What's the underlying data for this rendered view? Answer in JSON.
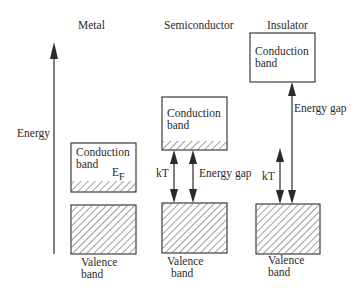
{
  "diagram": {
    "type": "energy band diagram",
    "axis": {
      "label": "Energy",
      "direction": "up"
    },
    "columns": [
      {
        "title": "Metal",
        "conduction_band": {
          "label_line1": "Conduction",
          "label_line2": "band",
          "partially_filled": true
        },
        "fermi_level": {
          "label": "E",
          "subscript": "F"
        },
        "valence_band": {
          "label_line1": "Valence",
          "label_line2": "band",
          "filled": true
        }
      },
      {
        "title": "Semiconductor",
        "conduction_band": {
          "label_line1": "Conduction",
          "label_line2": "band",
          "partially_filled": true
        },
        "valence_band": {
          "label_line1": "Valence",
          "label_line2": "band",
          "filled": true
        },
        "arrows": [
          {
            "label": "kT",
            "type": "double"
          },
          {
            "label": "Energy gap",
            "type": "double"
          }
        ]
      },
      {
        "title": "Insulator",
        "conduction_band": {
          "label_line1": "Conduction",
          "label_line2": "band",
          "partially_filled": false
        },
        "valence_band": {
          "label_line1": "Valence",
          "label_line2": "band",
          "filled": true
        },
        "arrows": [
          {
            "label": "Energy gap",
            "type": "double"
          },
          {
            "label": "kT",
            "type": "double"
          }
        ]
      }
    ]
  },
  "colors": {
    "ink": "#2a2a2a",
    "background": "#ffffff"
  }
}
